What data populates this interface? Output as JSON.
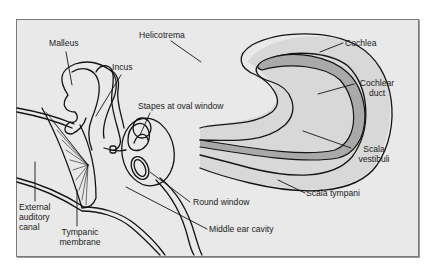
{
  "figure": {
    "colors": {
      "background": "#e9e9e9",
      "frame_border": "#7a7a7a",
      "outline": "#141414",
      "cochlear_duct_fill": "#a9a9a9",
      "scala_fill": "#d8d8d8",
      "page": "#ffffff"
    },
    "labels": {
      "malleus": "Malleus",
      "incus": "Incus",
      "helicotrema": "Helicotrema",
      "cochlea": "Cochlea",
      "cochlear_duct_line1": "Cochlear",
      "cochlear_duct_line2": "duct",
      "stapes": "Stapes at oval window",
      "scala_vestibuli_line1": "Scala",
      "scala_vestibuli_line2": "vestibuli",
      "scala_tympani": "Scala tympani",
      "round_window": "Round window",
      "middle_ear_cavity": "Middle ear cavity",
      "external_canal_line1": "External",
      "external_canal_line2": "auditory",
      "external_canal_line3": "canal",
      "tympanic_line1": "Tympanic",
      "tympanic_line2": "membrane"
    }
  }
}
